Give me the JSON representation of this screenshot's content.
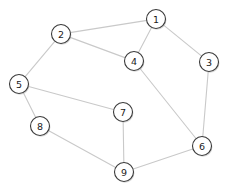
{
  "diagram": {
    "background_color": "#ffffff",
    "node_fill_color": "#ffffff",
    "node_stroke_color": "#3a3a3a",
    "node_label_color": "#1a1a1a",
    "edge_color": "#c9c9c9",
    "node_radius": 9.5,
    "width": 228,
    "height": 193
  },
  "chart_data": {
    "type": "graph",
    "title": "",
    "nodes": [
      {
        "id": "1",
        "label": "1",
        "x": 156,
        "y": 19
      },
      {
        "id": "2",
        "label": "2",
        "x": 61,
        "y": 34
      },
      {
        "id": "3",
        "label": "3",
        "x": 209,
        "y": 62
      },
      {
        "id": "4",
        "label": "4",
        "x": 134,
        "y": 61
      },
      {
        "id": "5",
        "label": "5",
        "x": 19,
        "y": 84
      },
      {
        "id": "6",
        "label": "6",
        "x": 202,
        "y": 146
      },
      {
        "id": "7",
        "label": "7",
        "x": 123,
        "y": 112
      },
      {
        "id": "8",
        "label": "8",
        "x": 40,
        "y": 126
      },
      {
        "id": "9",
        "label": "9",
        "x": 124,
        "y": 172
      }
    ],
    "edges": [
      {
        "source": "1",
        "target": "2"
      },
      {
        "source": "1",
        "target": "4"
      },
      {
        "source": "1",
        "target": "3"
      },
      {
        "source": "2",
        "target": "4"
      },
      {
        "source": "2",
        "target": "5"
      },
      {
        "source": "3",
        "target": "6"
      },
      {
        "source": "4",
        "target": "6"
      },
      {
        "source": "5",
        "target": "7"
      },
      {
        "source": "5",
        "target": "8"
      },
      {
        "source": "7",
        "target": "9"
      },
      {
        "source": "8",
        "target": "9"
      },
      {
        "source": "9",
        "target": "6"
      }
    ]
  }
}
